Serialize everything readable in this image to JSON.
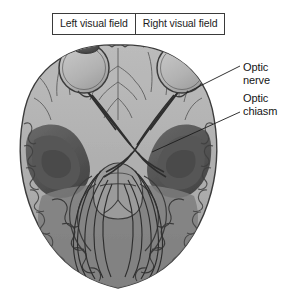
{
  "figure": {
    "type": "anatomical-illustration",
    "palette": {
      "background": "#ffffff",
      "brain_cortex_light": "#b9b9b9",
      "brain_cortex_mid": "#a6a6a6",
      "brain_interior_dark": "#5f5f5f",
      "brain_interior_darker": "#4a4a4a",
      "eye_fill": "#b4b4b4",
      "eye_pupil": "#4b4b4b",
      "outline": "#3c3c3c",
      "nerve_line": "#2e2e2e",
      "label_text": "#151515",
      "box_border": "#3a3a3a"
    }
  },
  "field_boxes": [
    {
      "id": "left-visual-field",
      "label": "Left visual field"
    },
    {
      "id": "right-visual-field",
      "label": "Right visual field"
    }
  ],
  "callouts": [
    {
      "id": "optic-nerve",
      "label": "Optic\nnerve"
    },
    {
      "id": "optic-chiasm",
      "label": "Optic\nchiasm"
    }
  ],
  "structures": {
    "left_eye": "left eyeball",
    "right_eye": "right eyeball",
    "optic_nerve": "optic nerve",
    "optic_chiasm": "optic chiasm",
    "optic_tract": "optic tract",
    "optic_radiation": "optic radiation",
    "occipital_cortex": "occipital cortex",
    "frontal_lobe": "frontal lobe",
    "temporal_lobe": "temporal lobe",
    "brainstem": "brainstem"
  }
}
